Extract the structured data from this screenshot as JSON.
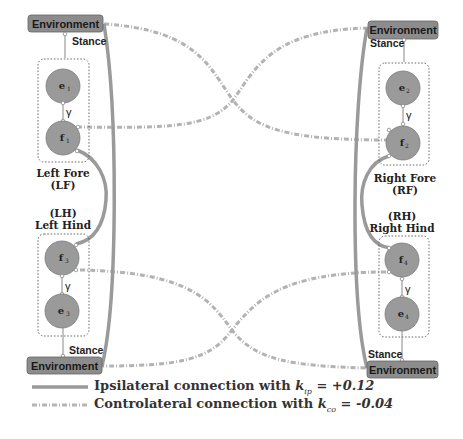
{
  "diagram": {
    "environment_label": "Environment",
    "stance_label": "Stance",
    "gamma_label": "γ",
    "legs": [
      {
        "id": "LF",
        "name": "Left Fore",
        "abbr": "(LF)",
        "extensor": "e",
        "extensor_sub": "1",
        "flexor": "f",
        "flexor_sub": "1"
      },
      {
        "id": "RF",
        "name": "Right Fore",
        "abbr": "(RF)",
        "extensor": "e",
        "extensor_sub": "2",
        "flexor": "f",
        "flexor_sub": "2"
      },
      {
        "id": "LH",
        "name": "Left Hind",
        "abbr": "(LH)",
        "extensor": "e",
        "extensor_sub": "3",
        "flexor": "f",
        "flexor_sub": "3"
      },
      {
        "id": "RH",
        "name": "Right Hind",
        "abbr": "(RH)",
        "extensor": "e",
        "extensor_sub": "4",
        "flexor": "f",
        "flexor_sub": "4"
      }
    ],
    "colors": {
      "node_fill": "#9a9a9a",
      "env_fill": "#8c8c8c",
      "ipsilateral": "#9b9b9b",
      "contralateral": "#b5b5b5"
    }
  },
  "legend": {
    "ipsilateral": {
      "text": "Ipsilateral connection with ",
      "k": "k",
      "sub": "ip",
      "value": " = +0.12"
    },
    "contralateral": {
      "text": "Controlateral connection with ",
      "k": "k",
      "sub": "co",
      "value": " = -0.04"
    }
  }
}
